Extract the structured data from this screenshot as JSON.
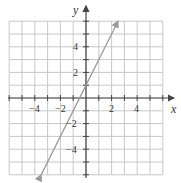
{
  "chart_data": {
    "type": "line",
    "title": "",
    "xlabel": "x",
    "ylabel": "y",
    "xlim": [
      -6,
      6
    ],
    "ylim": [
      -6,
      6
    ],
    "grid": true,
    "x_ticks": [
      -4,
      -2,
      2,
      4
    ],
    "y_ticks": [
      4,
      2,
      -2,
      -4
    ],
    "series": [
      {
        "name": "y = 2x + 1",
        "x": [
          -3.5,
          2.5
        ],
        "y": [
          -6,
          6
        ],
        "arrows": "both"
      }
    ]
  },
  "labels": {
    "x_axis": "x",
    "y_axis": "y",
    "xt0": "−4",
    "xt1": "−2",
    "xt2": "2",
    "xt3": "4",
    "yt0": "4",
    "yt1": "2",
    "yt2": "−2",
    "yt3": "−4"
  },
  "colors": {
    "grid": "#c8c8c8",
    "axis": "#444444",
    "line": "#999999"
  }
}
